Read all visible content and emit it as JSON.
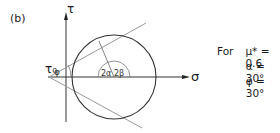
{
  "panel_label": "(b)",
  "axes": {
    "y_label": "τ",
    "x_label": "σ",
    "intercept_label": "τ₀"
  },
  "angles": {
    "phi": "φ",
    "two_alpha": "2α",
    "two_beta": "2β"
  },
  "legend": {
    "prefix": "For",
    "lines": [
      "μ* = 0.6",
      "α = 30°",
      "φ = 30°"
    ]
  },
  "colors": {
    "ink": "#1a1a1a",
    "tangent": "#9a9a9a"
  }
}
